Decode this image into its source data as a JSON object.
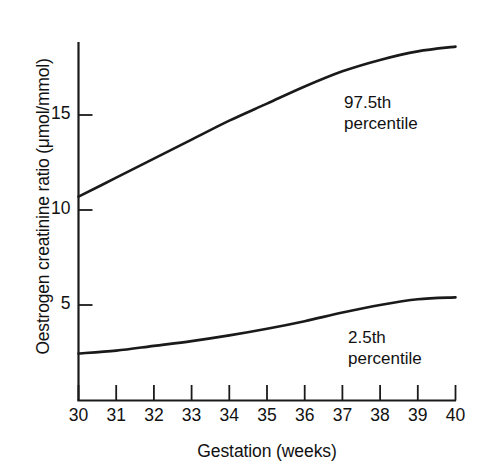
{
  "chart_data": {
    "type": "line",
    "title": "",
    "xlabel": "Gestation (weeks)",
    "ylabel": "Oestrogen creatinine ratio (μmol/mmol)",
    "xlim": [
      30,
      40
    ],
    "ylim": [
      0,
      19.5
    ],
    "xticks": [
      30,
      31,
      32,
      33,
      34,
      35,
      36,
      37,
      38,
      39,
      40
    ],
    "xtick_labels": [
      "30",
      "31",
      "32",
      "33",
      "34",
      "35",
      "36",
      "37",
      "38",
      "39",
      "40"
    ],
    "yticks": [
      5,
      10,
      15
    ],
    "ytick_labels": [
      "5",
      "10",
      "15"
    ],
    "grid": false,
    "legend_position": "inline-annotation",
    "x": [
      30,
      31,
      32,
      33,
      34,
      35,
      36,
      37,
      38,
      39,
      40
    ],
    "series": [
      {
        "name": "97.5th percentile",
        "color": "#1a1a1a",
        "values": [
          10.7,
          11.7,
          12.7,
          13.7,
          14.7,
          15.6,
          16.5,
          17.3,
          17.9,
          18.35,
          18.6
        ]
      },
      {
        "name": "2.5th percentile",
        "color": "#1a1a1a",
        "values": [
          2.45,
          2.6,
          2.85,
          3.1,
          3.4,
          3.75,
          4.15,
          4.6,
          5.0,
          5.3,
          5.4
        ]
      }
    ],
    "annotations": [
      {
        "id": "upper-annotation",
        "lines": [
          "97.5th",
          "percentile"
        ],
        "x_px": 344,
        "y_px": 92
      },
      {
        "id": "lower-annotation",
        "lines": [
          "2.5th",
          "percentile"
        ],
        "x_px": 348,
        "y_px": 327
      }
    ]
  },
  "colors": {
    "background": "#ffffff",
    "axis": "#1a1a1a",
    "curve": "#1a1a1a",
    "text": "#111111"
  }
}
